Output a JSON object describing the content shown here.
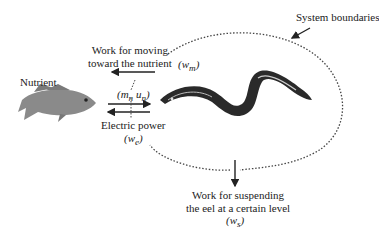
{
  "labels": {
    "system_boundaries": "System boundaries",
    "nutrient": "Nutrient",
    "work_moving_line1": "Work for moving",
    "work_moving_line2": "toward the nutrient",
    "w_m": "(w",
    "w_m_sub": "m",
    "mass_flow_open": "(m",
    "mass_flow_sub1": "n",
    "mass_flow_mid": " u",
    "mass_flow_sub2": "n",
    "electric_power": "Electric power",
    "w_e": "(w",
    "w_e_sub": "e",
    "work_suspending_line1": "Work for suspending",
    "work_suspending_line2": "the eel at a certain level",
    "w_s": "(w",
    "w_s_sub": "s",
    "close_paren": ")"
  },
  "colors": {
    "ink": "#222222",
    "dotted": "#444444",
    "fish": "#8a8a8a",
    "eel": "#2a2a2a"
  }
}
